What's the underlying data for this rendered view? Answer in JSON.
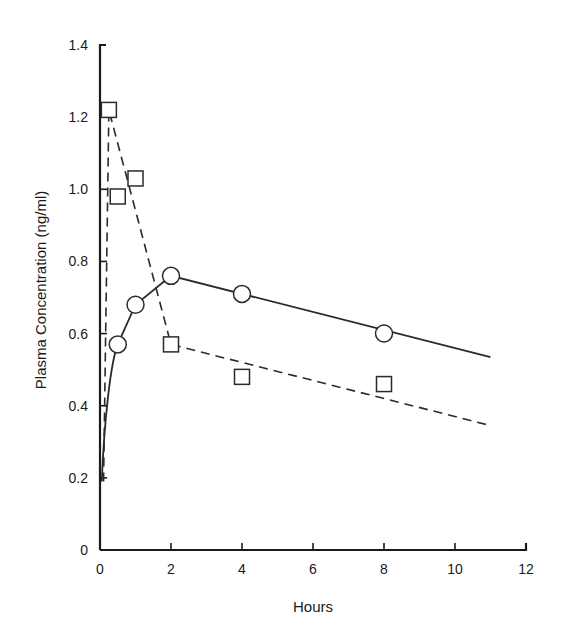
{
  "chart_data": {
    "type": "line",
    "title": "",
    "xlabel": "Hours",
    "ylabel": "Plasma Concentration (ng/ml)",
    "xlim": [
      0,
      12
    ],
    "ylim": [
      0,
      1.4
    ],
    "xticks": [
      0,
      2,
      4,
      6,
      8,
      10,
      12
    ],
    "xtick_labels": [
      "0",
      "2",
      "4",
      "6",
      "8",
      "10",
      "12"
    ],
    "yticks": [
      0,
      0.2,
      0.4,
      0.6,
      0.8,
      1.0,
      1.2,
      1.4
    ],
    "ytick_labels": [
      "0",
      "0.2",
      "0.4",
      "0.6",
      "0.8",
      "1.0",
      "1.2",
      "1.4"
    ],
    "grid": false,
    "legend": null,
    "series": [
      {
        "name": "circles (solid fit)",
        "marker": "circle",
        "line_style": "solid",
        "points": [
          {
            "x": 0.5,
            "y": 0.57
          },
          {
            "x": 1,
            "y": 0.68
          },
          {
            "x": 2,
            "y": 0.76
          },
          {
            "x": 4,
            "y": 0.71
          },
          {
            "x": 8,
            "y": 0.6
          }
        ],
        "fit_line": [
          {
            "x": 0.05,
            "y": 0.19
          },
          {
            "x": 0.2,
            "y": 0.42
          },
          {
            "x": 0.5,
            "y": 0.57
          },
          {
            "x": 1,
            "y": 0.68
          },
          {
            "x": 2,
            "y": 0.76
          },
          {
            "x": 11,
            "y": 0.535
          }
        ]
      },
      {
        "name": "squares (dashed fit)",
        "marker": "square",
        "line_style": "dashed",
        "points": [
          {
            "x": 0.25,
            "y": 1.22
          },
          {
            "x": 0.5,
            "y": 0.98
          },
          {
            "x": 1,
            "y": 1.03
          },
          {
            "x": 2,
            "y": 0.57
          },
          {
            "x": 4,
            "y": 0.48
          },
          {
            "x": 8,
            "y": 0.46
          }
        ],
        "fit_line": [
          {
            "x": 0.1,
            "y": 0.19
          },
          {
            "x": 0.25,
            "y": 1.22
          },
          {
            "x": 2,
            "y": 0.57
          },
          {
            "x": 11,
            "y": 0.345
          }
        ]
      }
    ]
  }
}
